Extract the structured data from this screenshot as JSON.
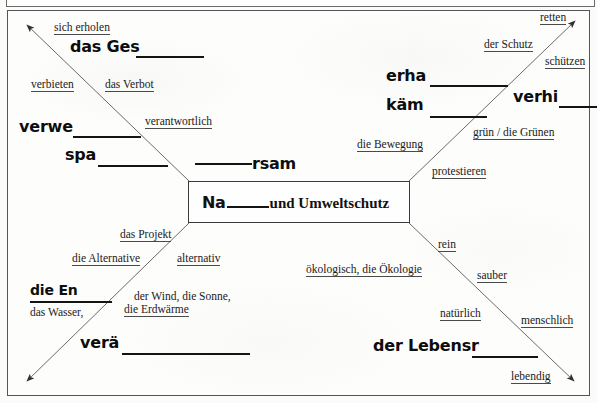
{
  "worksheet": {
    "type": "mind-map-vocabulary-worksheet",
    "language": "German",
    "center": {
      "prefix_handwritten": "Na",
      "blank": "____",
      "suffix_printed": "und Umweltschutz",
      "full_reading": "Natur und Umweltschutz"
    },
    "branches": {
      "top_left": {
        "labels": [
          {
            "text": "sich erholen"
          },
          {
            "text": "verbieten"
          },
          {
            "text": "das Verbot"
          },
          {
            "text": "verantwortlich"
          }
        ],
        "handwritten": [
          {
            "text": "das Ges"
          },
          {
            "text": "verwe"
          },
          {
            "text": "spa"
          },
          {
            "text": "rsam"
          }
        ]
      },
      "top_right": {
        "labels": [
          {
            "text": "retten"
          },
          {
            "text": "der Schutz"
          },
          {
            "text": "schützen"
          },
          {
            "text": "grün / die Grünen"
          },
          {
            "text": "die Bewegung"
          },
          {
            "text": "protestieren"
          }
        ],
        "handwritten": [
          {
            "text": "erha"
          },
          {
            "text": "käm"
          },
          {
            "text": "verhi"
          }
        ]
      },
      "bottom_left": {
        "labels": [
          {
            "text": "das Projekt"
          },
          {
            "text": "die Alternative"
          },
          {
            "text": "alternativ"
          },
          {
            "text": "der Wind, die Sonne,"
          },
          {
            "text": "die Erdwärme"
          },
          {
            "text": "das Wasser,"
          }
        ],
        "handwritten": [
          {
            "text": "die En"
          },
          {
            "text": "verä"
          }
        ]
      },
      "bottom_right": {
        "labels": [
          {
            "text": "rein"
          },
          {
            "text": "ökologisch, die Ökologie"
          },
          {
            "text": "sauber"
          },
          {
            "text": "natürlich"
          },
          {
            "text": "menschlich"
          },
          {
            "text": "lebendig"
          }
        ],
        "handwritten": [
          {
            "text": "der Lebensr"
          }
        ]
      }
    },
    "colors": {
      "paper": "#fdfdfc",
      "ink": "#1a1a1a",
      "rule": "#4a4a4a",
      "blank_rule": "#141414",
      "frame": "#555555"
    }
  }
}
